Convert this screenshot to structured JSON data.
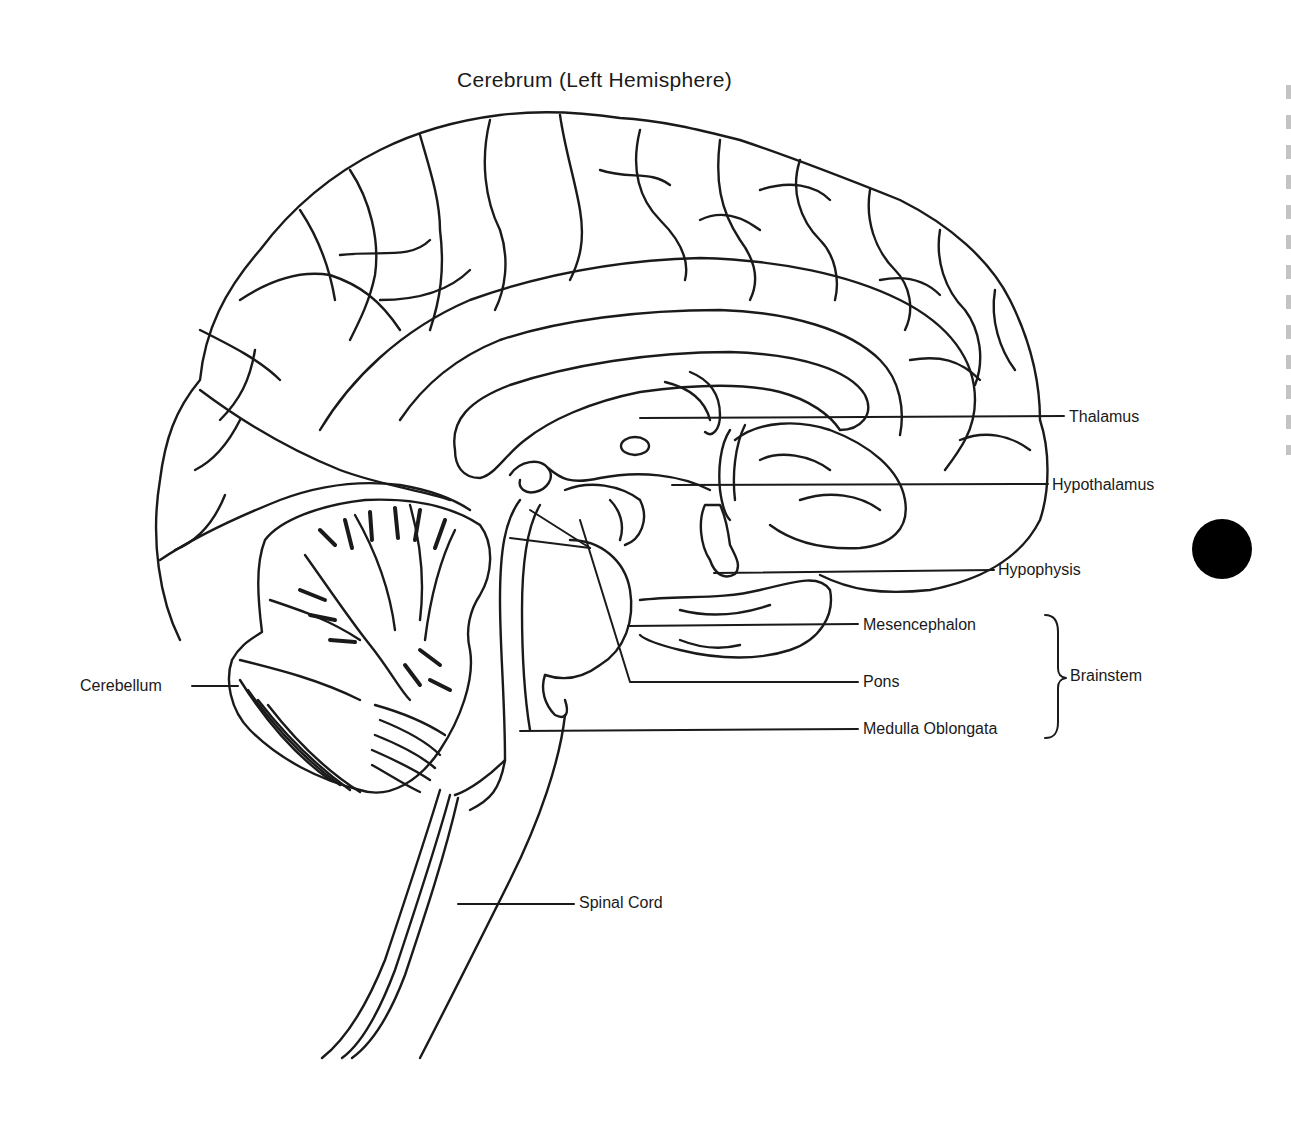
{
  "diagram": {
    "title": "Cerebrum (Left Hemisphere)",
    "colors": {
      "line": "#1a1a1a",
      "background": "#ffffff",
      "marker": "#000000"
    },
    "labels": {
      "thalamus": "Thalamus",
      "hypothalamus": "Hypothalamus",
      "hypophysis": "Hypophysis",
      "mesencephalon": "Mesencephalon",
      "pons": "Pons",
      "medulla": "Medulla Oblongata",
      "brainstem": "Brainstem",
      "cerebellum": "Cerebellum",
      "spinal_cord": "Spinal Cord"
    },
    "groups": [
      {
        "name": "Brainstem",
        "members": [
          "Mesencephalon",
          "Pons",
          "Medulla Oblongata"
        ]
      }
    ],
    "decorations": {
      "black_dot": "black-circle-marker"
    }
  }
}
